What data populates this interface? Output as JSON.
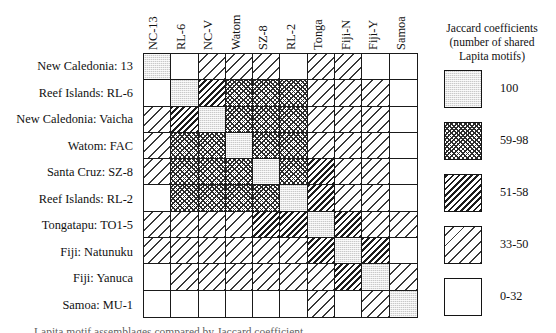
{
  "figure": {
    "type": "matrix-heatmap",
    "row_labels": [
      "New Caledonia: 13",
      "Reef Islands: RL-6",
      "New Caledonia: Vaicha",
      "Watom: FAC",
      "Santa Cruz: SZ-8",
      "Reef Islands: RL-2",
      "Tongatapu: TO1-5",
      "Fiji: Natunuku",
      "Fiji: Yanuca",
      "Samoa: MU-1"
    ],
    "col_labels": [
      "NC-13",
      "RL-6",
      "NC-V",
      "Watom",
      "SZ-8",
      "RL-2",
      "Tonga",
      "Fiji-N",
      "Fiji-Y",
      "Samoa"
    ],
    "caption_fragment": "Lapita motif assemblages compared by Jaccard coefficient"
  },
  "legend": {
    "title_lines": [
      "Jaccard coefficients",
      "(number of shared",
      "Lapita motifs)"
    ],
    "entries": [
      {
        "key": "p100",
        "label": "100"
      },
      {
        "key": "p5998",
        "label": "59-98"
      },
      {
        "key": "p5158",
        "label": "51-58"
      },
      {
        "key": "p3350",
        "label": "33-50"
      },
      {
        "key": "p032",
        "label": "0-32"
      }
    ]
  },
  "chart_data": {
    "type": "heatmap",
    "xlabel": "",
    "ylabel": "",
    "symmetric": true,
    "legend_position": "right",
    "grid": true,
    "categories_x": [
      "NC-13",
      "RL-6",
      "NC-V",
      "Watom",
      "SZ-8",
      "RL-2",
      "Tonga",
      "Fiji-N",
      "Fiji-Y",
      "Samoa"
    ],
    "categories_y": [
      "New Caledonia: 13",
      "Reef Islands: RL-6",
      "New Caledonia: Vaicha",
      "Watom: FAC",
      "Santa Cruz: SZ-8",
      "Reef Islands: RL-2",
      "Tongatapu: TO1-5",
      "Fiji: Natunuku",
      "Fiji: Yanuca",
      "Samoa: MU-1"
    ],
    "bins": [
      {
        "key": "p100",
        "label": "100",
        "range": [
          100,
          100
        ]
      },
      {
        "key": "p5998",
        "label": "59-98",
        "range": [
          59,
          98
        ]
      },
      {
        "key": "p5158",
        "label": "51-58",
        "range": [
          51,
          58
        ]
      },
      {
        "key": "p3350",
        "label": "33-50",
        "range": [
          33,
          50
        ]
      },
      {
        "key": "p032",
        "label": "0-32",
        "range": [
          0,
          32
        ]
      }
    ],
    "values": [
      [
        "p100",
        "p032",
        "p3350",
        "p3350",
        "p3350",
        "p032",
        "p3350",
        "p3350",
        "p032",
        "p032"
      ],
      [
        "p032",
        "p100",
        "p5158",
        "p5998",
        "p5998",
        "p5998",
        "p3350",
        "p3350",
        "p3350",
        "p032"
      ],
      [
        "p3350",
        "p5158",
        "p100",
        "p5998",
        "p5998",
        "p5998",
        "p3350",
        "p3350",
        "p3350",
        "p032"
      ],
      [
        "p3350",
        "p5998",
        "p5998",
        "p100",
        "p5998",
        "p5998",
        "p3350",
        "p3350",
        "p3350",
        "p032"
      ],
      [
        "p3350",
        "p5998",
        "p5998",
        "p5998",
        "p100",
        "p5998",
        "p5158",
        "p3350",
        "p3350",
        "p032"
      ],
      [
        "p032",
        "p5998",
        "p5998",
        "p5998",
        "p5998",
        "p100",
        "p5158",
        "p3350",
        "p3350",
        "p032"
      ],
      [
        "p3350",
        "p3350",
        "p3350",
        "p3350",
        "p5158",
        "p5158",
        "p100",
        "p5158",
        "p3350",
        "p3350"
      ],
      [
        "p3350",
        "p3350",
        "p3350",
        "p3350",
        "p3350",
        "p3350",
        "p5158",
        "p100",
        "p5158",
        "p032"
      ],
      [
        "p032",
        "p3350",
        "p3350",
        "p3350",
        "p3350",
        "p3350",
        "p3350",
        "p5158",
        "p100",
        "p3350"
      ],
      [
        "p032",
        "p032",
        "p032",
        "p032",
        "p032",
        "p032",
        "p3350",
        "p032",
        "p3350",
        "p100"
      ]
    ]
  }
}
